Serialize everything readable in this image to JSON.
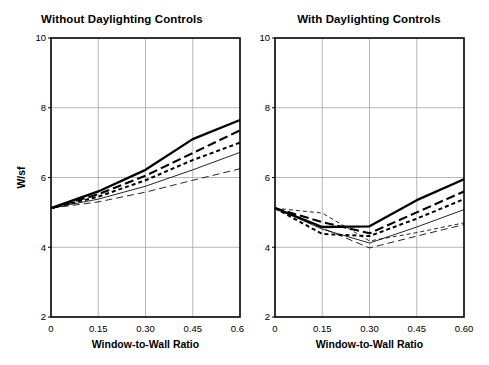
{
  "figure": {
    "background": "#ffffff",
    "line_color": "#000000",
    "grid_color": "#9a9a9a",
    "axis_color": "#000000"
  },
  "panels": [
    {
      "id": "without-daylighting-controls",
      "title": "Without Daylighting Controls",
      "ylabel": "W/sf",
      "xlabel": "Window-to-Wall Ratio",
      "show_ylabel": true
    },
    {
      "id": "with-daylighting-controls",
      "title": "With Daylighting Controls",
      "ylabel": "",
      "xlabel": "Window-to-Wall Ratio",
      "show_ylabel": false
    }
  ],
  "axes": {
    "y_ticks": [
      "10",
      "8",
      "6",
      "4",
      "2"
    ],
    "y_tick_values": [
      10,
      8,
      6,
      4,
      2
    ],
    "x_ticks": [
      "0",
      "0.15",
      "0.30",
      "0.45",
      "0.60"
    ],
    "x_tick_values": [
      0,
      0.15,
      0.3,
      0.45,
      0.6
    ],
    "ylim": [
      2,
      10
    ],
    "xlim": [
      0,
      0.6
    ]
  },
  "chart_data": [
    {
      "type": "line",
      "title": "Without Daylighting Controls",
      "xlabel": "Window-to-Wall Ratio",
      "ylabel": "W/sf",
      "x": [
        0,
        0.15,
        0.3,
        0.45,
        0.6
      ],
      "xlim": [
        0,
        0.6
      ],
      "ylim": [
        2,
        10
      ],
      "grid": true,
      "legend": "none",
      "series": [
        {
          "name": "series-1",
          "style": "solid-thick",
          "values": [
            5.12,
            5.6,
            6.22,
            7.1,
            7.65
          ]
        },
        {
          "name": "series-2",
          "style": "dashed-long",
          "values": [
            5.12,
            5.52,
            6.05,
            6.7,
            7.35
          ]
        },
        {
          "name": "series-3",
          "style": "dashed-short",
          "values": [
            5.12,
            5.45,
            5.92,
            6.5,
            7.0
          ]
        },
        {
          "name": "series-4",
          "style": "solid-thin",
          "values": [
            5.12,
            5.38,
            5.75,
            6.22,
            6.72
          ]
        },
        {
          "name": "series-5",
          "style": "dashed-thin",
          "values": [
            5.12,
            5.3,
            5.58,
            5.92,
            6.25
          ]
        }
      ]
    },
    {
      "type": "line",
      "title": "With Daylighting Controls",
      "xlabel": "Window-to-Wall Ratio",
      "ylabel": "W/sf",
      "x": [
        0,
        0.15,
        0.3,
        0.45,
        0.6
      ],
      "xlim": [
        0,
        0.6
      ],
      "ylim": [
        2,
        10
      ],
      "grid": true,
      "legend": "none",
      "series": [
        {
          "name": "series-1",
          "style": "solid-thick",
          "values": [
            5.12,
            4.58,
            4.6,
            5.35,
            5.95
          ]
        },
        {
          "name": "series-2",
          "style": "dashed-long",
          "values": [
            5.12,
            4.72,
            4.4,
            5.0,
            5.6
          ]
        },
        {
          "name": "series-3",
          "style": "dashed-short",
          "values": [
            5.12,
            4.38,
            4.32,
            4.82,
            5.38
          ]
        },
        {
          "name": "series-4",
          "style": "solid-thin",
          "values": [
            5.12,
            4.52,
            4.12,
            4.58,
            5.08
          ]
        },
        {
          "name": "series-5",
          "style": "dashed-thin-b",
          "values": [
            5.12,
            4.98,
            4.18,
            4.42,
            4.7
          ]
        },
        {
          "name": "series-6",
          "style": "dashed-thin",
          "values": [
            5.12,
            4.55,
            3.98,
            4.32,
            4.65
          ]
        }
      ]
    }
  ]
}
